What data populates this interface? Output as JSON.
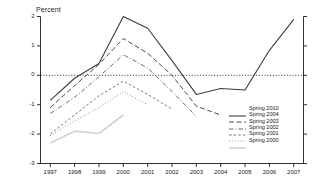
{
  "chart_data": {
    "type": "line",
    "title": "",
    "ylabel": "Percent",
    "xlabel": "",
    "ylim": [
      -3,
      2
    ],
    "xlim": [
      1996.6,
      2007.4
    ],
    "yticks": [
      2,
      1,
      0,
      -1,
      -2,
      -3
    ],
    "ytick_labels": [
      "2",
      "1",
      "0",
      "-1",
      "-2",
      "-3"
    ],
    "xticks": [
      1997,
      1998,
      1999,
      2000,
      2001,
      2002,
      2003,
      2004,
      2005,
      2006,
      2007
    ],
    "xtick_labels": [
      "1997",
      "1998",
      "1999",
      "2000",
      "2001",
      "2002",
      "2003",
      "2004",
      "2005",
      "2006",
      "2007"
    ],
    "grid": false,
    "zero_line": true,
    "legend_position": "center-right",
    "series": [
      {
        "name": "Spring 2010",
        "style": "solid",
        "color": "#3c3c3c",
        "width": 1.1,
        "x": [
          1997,
          1998,
          1999,
          2000,
          2001,
          2002,
          2003,
          2004,
          2005,
          2006,
          2007
        ],
        "y": [
          -0.85,
          -0.1,
          0.4,
          2.0,
          1.6,
          0.5,
          -0.65,
          -0.45,
          -0.5,
          0.85,
          1.9
        ]
      },
      {
        "name": "Spring 2004",
        "style": "long-dash",
        "color": "#4a4a4a",
        "width": 1.0,
        "x": [
          1997,
          1998,
          1999,
          2000,
          2001,
          2002,
          2003,
          2004
        ],
        "y": [
          -1.1,
          -0.35,
          0.37,
          1.25,
          0.75,
          0.0,
          -1.05,
          -1.35
        ]
      },
      {
        "name": "Spring 2003",
        "style": "dash-dot",
        "color": "#6e6e6e",
        "width": 1.0,
        "x": [
          1997,
          1998,
          1999,
          2000,
          2001,
          2002,
          2003
        ],
        "y": [
          -1.3,
          -0.75,
          -0.05,
          0.7,
          0.25,
          -0.55,
          -1.4
        ]
      },
      {
        "name": "Spring 2002",
        "style": "dashed",
        "color": "#7d7d7d",
        "width": 1.0,
        "x": [
          1997,
          1998,
          1999,
          2000,
          2001,
          2002
        ],
        "y": [
          -2.0,
          -1.35,
          -0.7,
          -0.2,
          -0.65,
          -1.15
        ]
      },
      {
        "name": "Spring 2001",
        "style": "dotted",
        "color": "#8c8c8c",
        "width": 1.0,
        "x": [
          1997,
          1998,
          1999,
          2000,
          2001
        ],
        "y": [
          -2.05,
          -1.55,
          -1.1,
          -0.55,
          -1.0
        ]
      },
      {
        "name": "Spring 2000",
        "style": "solid-light",
        "color": "#d2d2d2",
        "width": 1.6,
        "x": [
          1997,
          1998,
          1999,
          2000
        ],
        "y": [
          -2.3,
          -1.9,
          -1.98,
          -1.35
        ]
      }
    ]
  }
}
